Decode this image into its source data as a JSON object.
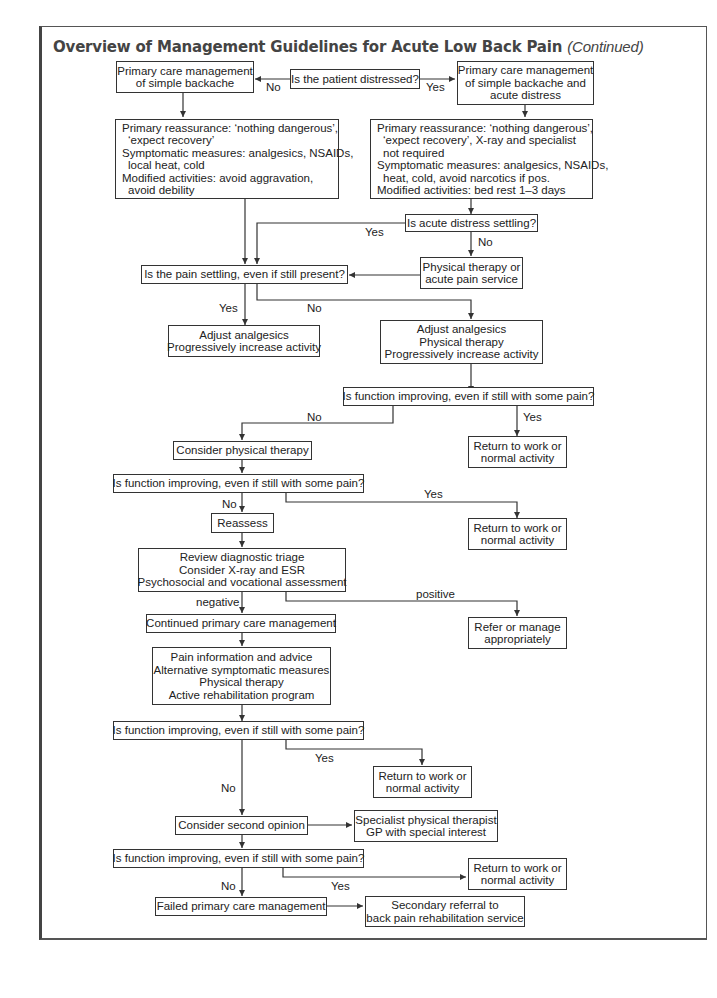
{
  "title": {
    "main": "Overview of Management Guidelines for Acute Low Back Pain",
    "suffix": "(Continued)"
  },
  "nodes": {
    "q_distressed": [
      "Is the patient distressed?"
    ],
    "pc_simple": [
      "Primary care management",
      "of simple backache"
    ],
    "pc_distress": [
      "Primary care management",
      "of simple backache and",
      "acute distress"
    ],
    "advice_simple": [
      "Primary reassurance: ‘nothing dangerous’,",
      "‘expect recovery’",
      "Symptomatic measures: analgesics, NSAIDs,",
      "local heat, cold",
      "Modified activities: avoid aggravation,",
      "avoid debility"
    ],
    "advice_distress": [
      "Primary reassurance: ‘nothing dangerous’,",
      "‘expect recovery’, X-ray and specialist",
      "not required",
      "Symptomatic measures: analgesics, NSAIDs,",
      "heat, cold, avoid narcotics if pos.",
      "Modified activities: bed rest 1–3 days"
    ],
    "q_distress_settling": [
      "Is acute distress settling?"
    ],
    "pt_acute": [
      "Physical therapy or",
      "acute pain service"
    ],
    "q_pain_settling": [
      "Is the pain settling, even if still present?"
    ],
    "adjust_a": [
      "Adjust analgesics",
      "Progressively increase activity"
    ],
    "adjust_b": [
      "Adjust analgesics",
      "Physical therapy",
      "Progressively increase activity"
    ],
    "q_function_1": [
      "Is function improving, even if still with some pain?"
    ],
    "consider_pt": [
      "Consider physical therapy"
    ],
    "rtw_1": [
      "Return to work or",
      "normal activity"
    ],
    "q_function_2": [
      "Is function improving, even if still with some pain?"
    ],
    "reassess": [
      "Reassess"
    ],
    "rtw_2": [
      "Return to work or",
      "normal activity"
    ],
    "review": [
      "Review diagnostic triage",
      "Consider X-ray and ESR",
      "Psychosocial and vocational assessment"
    ],
    "continued_pc": [
      "Continued primary care management"
    ],
    "refer": [
      "Refer or manage",
      "appropriately"
    ],
    "pain_info": [
      "Pain information and advice",
      "Alternative symptomatic measures",
      "Physical therapy",
      "Active rehabilitation program"
    ],
    "q_function_3": [
      "Is function improving, even if still with some pain?"
    ],
    "rtw_3": [
      "Return to work or",
      "normal activity"
    ],
    "second_opinion": [
      "Consider second opinion"
    ],
    "specialist": [
      "Specialist physical therapist",
      "GP with special interest"
    ],
    "q_function_4": [
      "Is function improving, even if still with some pain?"
    ],
    "rtw_4": [
      "Return to work or",
      "normal activity"
    ],
    "failed_pc": [
      "Failed primary care management"
    ],
    "secondary_referral": [
      "Secondary referral to",
      "back pain rehabilitation service"
    ]
  },
  "edge_labels": {
    "distressed_no": "No",
    "distressed_yes": "Yes",
    "distress_settling_yes": "Yes",
    "distress_settling_no": "No",
    "pain_settling_yes": "Yes",
    "pain_settling_no": "No",
    "function1_no": "No",
    "function1_yes": "Yes",
    "function2_no": "No",
    "function2_yes": "Yes",
    "review_negative": "negative",
    "review_positive": "positive",
    "function3_yes": "Yes",
    "function3_no": "No",
    "function4_no": "No",
    "function4_yes": "Yes"
  },
  "colors": {
    "line": "#333333",
    "title": "#444444",
    "frame": "#555555"
  }
}
